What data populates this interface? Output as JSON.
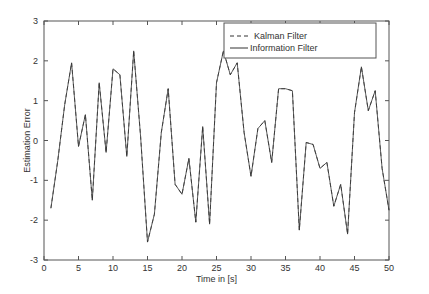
{
  "chart_data": {
    "type": "line",
    "title": "",
    "xlabel": "Time in [s]",
    "ylabel": "Estimation Error",
    "xlim": [
      0,
      50
    ],
    "ylim": [
      -3,
      3
    ],
    "xticks": [
      0,
      5,
      10,
      15,
      20,
      25,
      30,
      35,
      40,
      45,
      50
    ],
    "yticks": [
      -3,
      -2,
      -1,
      0,
      1,
      2,
      3
    ],
    "grid": false,
    "legend_position": "upper right",
    "legend": [
      "Kalman Filter",
      "Information Filter"
    ],
    "x": [
      1,
      2,
      3,
      4,
      5,
      6,
      7,
      8,
      9,
      10,
      11,
      12,
      13,
      14,
      15,
      16,
      17,
      18,
      19,
      20,
      21,
      22,
      23,
      24,
      25,
      26,
      27,
      28,
      29,
      30,
      31,
      32,
      33,
      34,
      35,
      36,
      37,
      38,
      39,
      40,
      41,
      42,
      43,
      44,
      45,
      46,
      47,
      48,
      49,
      50
    ],
    "series": [
      {
        "name": "Kalman Filter",
        "style": "dashed",
        "values": [
          -1.7,
          -0.5,
          0.9,
          1.95,
          -0.15,
          0.65,
          -1.5,
          1.45,
          -0.3,
          1.8,
          1.65,
          -0.4,
          2.25,
          0.1,
          -2.55,
          -1.85,
          0.2,
          1.3,
          -1.1,
          -1.35,
          -0.45,
          -2.05,
          0.35,
          -2.1,
          1.45,
          2.25,
          1.65,
          1.95,
          0.2,
          -0.9,
          0.3,
          0.5,
          -0.55,
          1.3,
          1.3,
          1.25,
          -2.25,
          -0.05,
          -0.1,
          -0.7,
          -0.55,
          -1.65,
          -1.1,
          -2.35,
          0.7,
          1.85,
          0.75,
          1.25,
          -0.7,
          -1.75
        ]
      },
      {
        "name": "Information Filter",
        "style": "solid",
        "values": [
          -1.7,
          -0.5,
          0.9,
          1.95,
          -0.15,
          0.65,
          -1.5,
          1.45,
          -0.3,
          1.8,
          1.65,
          -0.4,
          2.25,
          0.1,
          -2.55,
          -1.85,
          0.2,
          1.3,
          -1.1,
          -1.35,
          -0.45,
          -2.05,
          0.35,
          -2.1,
          1.45,
          2.25,
          1.65,
          1.95,
          0.2,
          -0.9,
          0.3,
          0.5,
          -0.55,
          1.3,
          1.3,
          1.25,
          -2.25,
          -0.05,
          -0.1,
          -0.7,
          -0.55,
          -1.65,
          -1.1,
          -2.35,
          0.7,
          1.85,
          0.75,
          1.25,
          -0.7,
          -1.75
        ]
      }
    ]
  },
  "colors": {
    "line": "#333333",
    "axis": "#555555",
    "background": "#ffffff"
  }
}
